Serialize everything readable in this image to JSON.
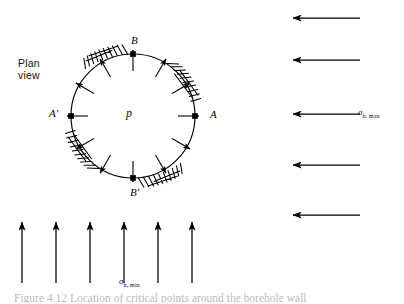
{
  "figure": {
    "plan_view_label": "Plan\nview",
    "center_pressure_label": "p",
    "caption_partial": "Figure 4.12  Location of critical points around the borehole wall",
    "ink_color": "#000000",
    "background_color": "#ffffff"
  },
  "borehole": {
    "center_x": 133,
    "center_y": 116,
    "radius": 62,
    "points": [
      {
        "id": "A",
        "label": "A",
        "angle_deg": 0,
        "dot": true
      },
      {
        "id": "B",
        "label": "B",
        "angle_deg": 90,
        "dot": true
      },
      {
        "id": "Ap",
        "label": "A'",
        "angle_deg": 180,
        "dot": true
      },
      {
        "id": "Bp",
        "label": "B'",
        "angle_deg": 270,
        "dot": true
      }
    ],
    "radial_arrow_count": 12,
    "radial_arrow_angles_deg": [
      0,
      30,
      60,
      90,
      120,
      150,
      180,
      210,
      240,
      270,
      300,
      330
    ],
    "radial_arrow_direction": "outward",
    "breakout_zones": [
      {
        "id": "zone-near-B",
        "start_angle_deg": 95,
        "end_angle_deg": 133
      },
      {
        "id": "zone-near-Bp",
        "start_angle_deg": 275,
        "end_angle_deg": 313
      },
      {
        "id": "zone-near-A",
        "start_angle_deg": 22,
        "end_angle_deg": 56
      },
      {
        "id": "zone-near-Ap",
        "start_angle_deg": 202,
        "end_angle_deg": 236
      }
    ]
  },
  "far_field_horizontal": {
    "label_symbol": "σ",
    "label_subscript": "h, max",
    "direction": "left",
    "arrow_count": 5,
    "arrow_tip_x": 293,
    "arrow_tail_x": 360,
    "arrow_y_positions": [
      18,
      60,
      114,
      165,
      215
    ]
  },
  "far_field_vertical": {
    "label_symbol": "σ",
    "label_subscript": "h, min",
    "direction": "up",
    "arrow_count": 6,
    "arrow_tip_y": 222,
    "arrow_tail_y": 283,
    "arrow_x_positions": [
      22,
      56,
      90,
      124,
      158,
      192
    ]
  }
}
